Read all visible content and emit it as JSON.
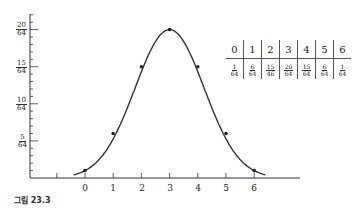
{
  "chart_data": {
    "type": "line",
    "title": "",
    "xlabel": "",
    "ylabel": "",
    "x": [
      0,
      1,
      2,
      3,
      4,
      5,
      6
    ],
    "values": [
      0.015625,
      0.09375,
      0.234375,
      0.3125,
      0.234375,
      0.09375,
      0.015625
    ],
    "values_as_fractions": [
      "1/64",
      "6/64",
      "15/64",
      "20/64",
      "15/64",
      "6/64",
      "1/64"
    ],
    "x_tick_labels": [
      "",
      "0",
      "1",
      "2",
      "3",
      "4",
      "5",
      "6"
    ],
    "y_tick_labels": [
      {
        "num": "5",
        "den": "64"
      },
      {
        "num": "10",
        "den": "64"
      },
      {
        "num": "15",
        "den": "64"
      },
      {
        "num": "20",
        "den": "64"
      }
    ],
    "ylim": [
      0,
      0.34
    ],
    "xlim": [
      -2,
      7
    ],
    "grid": false,
    "legend": null,
    "curve": "smooth bell-shaped curve through points",
    "line_color": "#333333"
  },
  "table": {
    "header": [
      "0",
      "1",
      "2",
      "3",
      "4",
      "5",
      "6"
    ],
    "row": [
      {
        "num": "1",
        "den": "64"
      },
      {
        "num": "6",
        "den": "64"
      },
      {
        "num": "15",
        "den": "46"
      },
      {
        "num": "20",
        "den": "64"
      },
      {
        "num": "15",
        "den": "64"
      },
      {
        "num": "6",
        "den": "64"
      },
      {
        "num": "1",
        "den": "64"
      }
    ]
  },
  "caption": "그림 23.3"
}
